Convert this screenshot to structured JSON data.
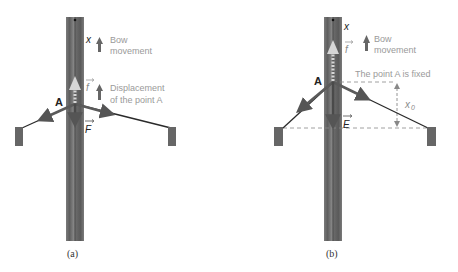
{
  "panels": [
    {
      "caption": "(a)",
      "axis_label": "x",
      "point_label": "A",
      "friction_label": "f",
      "force_label": "F",
      "legend": [
        {
          "icon": "up-arrow-icon",
          "line1": "Bow",
          "line2": "movement"
        },
        {
          "icon": "up-arrow-icon",
          "line1": "Displacement",
          "line2": "of the point A"
        }
      ]
    },
    {
      "caption": "(b)",
      "axis_label": "x",
      "point_label": "A",
      "friction_label": "f",
      "force_label": "E",
      "fixed_note": "The point A is fixed",
      "displacement_label": "x",
      "displacement_sub": "0",
      "legend": [
        {
          "icon": "up-arrow-icon",
          "line1": "Bow",
          "line2": "movement"
        }
      ]
    }
  ],
  "colors": {
    "stick": "#6e6e6e",
    "stick_dark": "#555555",
    "string": "#2a2a2a",
    "arrow": "#5a5a5a",
    "friction_arrow": "#d6d6d6",
    "anchor": "#666666",
    "text_light": "#9a9a9a"
  }
}
